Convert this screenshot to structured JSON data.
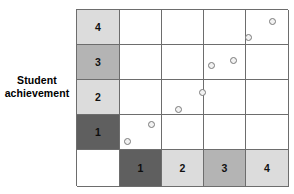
{
  "figure": {
    "type": "scatter-matrix",
    "y_axis_caption_line1": "Student",
    "y_axis_caption_line2": "achievement"
  },
  "y_axis": {
    "labels": [
      "4",
      "3",
      "2",
      "1"
    ],
    "shades": [
      "#dcdcdc",
      "#b4b4b4",
      "#dcdcdc",
      "#5f5f5f"
    ]
  },
  "x_axis": {
    "corner_label": "",
    "labels": [
      "1",
      "2",
      "3",
      "4"
    ],
    "shades": [
      "#5f5f5f",
      "#dcdcdc",
      "#b4b4b4",
      "#dcdcdc"
    ]
  },
  "chart_data": {
    "type": "scatter",
    "title": "",
    "xlabel": "",
    "ylabel": "Student achievement",
    "xlim": [
      0,
      4
    ],
    "ylim": [
      0,
      4
    ],
    "xticks": [
      "1",
      "2",
      "3",
      "4"
    ],
    "yticks": [
      "1",
      "2",
      "3",
      "4"
    ],
    "grid": true,
    "legend": null,
    "series": [
      {
        "name": "observations",
        "marker": "open-circle",
        "marker_color": "#7a7a7a",
        "points": [
          {
            "px": 127,
            "py": 141,
            "x": 0.45,
            "y": 0.55
          },
          {
            "px": 151,
            "py": 124,
            "x": 1.0,
            "y": 1.0
          },
          {
            "px": 178,
            "py": 109,
            "x": 1.65,
            "y": 1.4
          },
          {
            "px": 202,
            "py": 92,
            "x": 2.2,
            "y": 1.9
          },
          {
            "px": 211,
            "py": 65,
            "x": 2.4,
            "y": 2.65
          },
          {
            "px": 233,
            "py": 60,
            "x": 2.95,
            "y": 2.8
          },
          {
            "px": 248,
            "py": 37,
            "x": 3.3,
            "y": 3.45
          },
          {
            "px": 272,
            "py": 21,
            "x": 3.85,
            "y": 3.9
          }
        ]
      }
    ]
  }
}
